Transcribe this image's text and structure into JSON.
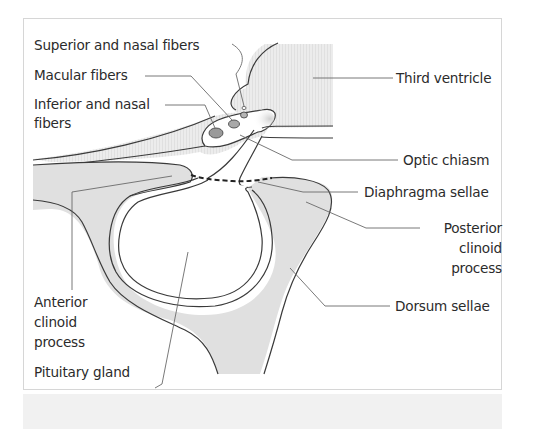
{
  "figure": {
    "colors": {
      "bone_fill": "#e0e0e0",
      "outline": "#3a3a3a",
      "leader": "#6a6a6a",
      "ventricle_fill": "#e6e6e6",
      "fiber_fill": "#9a9a9a",
      "frame_border": "#d6d6d6",
      "bottom_strip": "#f1f1f1"
    },
    "labels": {
      "superior_nasal_fibers": "Superior and nasal fibers",
      "macular_fibers": "Macular fibers",
      "inferior_nasal_fibers_line1": "Inferior and nasal",
      "inferior_nasal_fibers_line2": "fibers",
      "third_ventricle": "Third ventricle",
      "optic_chiasm": "Optic chiasm",
      "diaphragma_sellae": "Diaphragma sellae",
      "posterior_clinoid_line1": "Posterior",
      "posterior_clinoid_line2": "clinoid",
      "posterior_clinoid_line3": "process",
      "dorsum_sellae": "Dorsum sellae",
      "anterior_clinoid_line1": "Anterior",
      "anterior_clinoid_line2": "clinoid",
      "anterior_clinoid_line3": "process",
      "pituitary_gland": "Pituitary gland"
    }
  }
}
